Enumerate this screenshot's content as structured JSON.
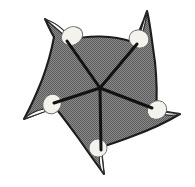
{
  "figure": {
    "caption": "",
    "canvas": {
      "width": 195,
      "height": 187,
      "background": "#ffffff"
    }
  },
  "style": {
    "background_color": "#ffffff",
    "body_fill_color": "#7c7c7c",
    "body_fill_pattern": "dither-halftone",
    "dither_dark": "#4a4a4a",
    "dither_light": "#9d9d9d",
    "outline_color": "#1a1a1a",
    "outline_width": 2.0,
    "spine_outline_width": 1.6,
    "radial_line_color": "#111111",
    "radial_line_width": 3.0,
    "pore_fill_color": "#f2f0ea",
    "pore_outline_color": "#5a5a5a"
  },
  "geometry": {
    "symmetry": "5-fold radial",
    "arm_count": 5,
    "center": {
      "x": 100,
      "y": 88
    },
    "spine_tips": [
      {
        "name": "spine-top-left",
        "x": 45,
        "y": 19
      },
      {
        "name": "spine-top-right",
        "x": 147,
        "y": 11
      },
      {
        "name": "spine-right",
        "x": 180,
        "y": 114
      },
      {
        "name": "spine-bottom",
        "x": 104,
        "y": 174
      },
      {
        "name": "spine-left",
        "x": 24,
        "y": 119
      }
    ],
    "body_vertices": [
      {
        "name": "vertex-top-left",
        "x": 69,
        "y": 44
      },
      {
        "name": "vertex-top-right",
        "x": 136,
        "y": 45
      },
      {
        "name": "vertex-right",
        "x": 155,
        "y": 109
      },
      {
        "name": "vertex-bottom",
        "x": 100,
        "y": 146
      },
      {
        "name": "vertex-left",
        "x": 53,
        "y": 104
      }
    ],
    "pores": [
      {
        "name": "pore-top-left",
        "cx": 72,
        "cy": 36,
        "rx": 11,
        "ry": 9,
        "rotation": -25
      },
      {
        "name": "pore-top-right",
        "cx": 139,
        "cy": 39,
        "rx": 10,
        "ry": 9,
        "rotation": 20
      },
      {
        "name": "pore-right",
        "cx": 157,
        "cy": 110,
        "rx": 9,
        "ry": 10,
        "rotation": 55
      },
      {
        "name": "pore-bottom",
        "cx": 98,
        "cy": 148,
        "rx": 9,
        "ry": 9,
        "rotation": 0
      },
      {
        "name": "pore-left",
        "cx": 52,
        "cy": 104,
        "rx": 10,
        "ry": 9,
        "rotation": -60
      }
    ],
    "radial_segments": [
      {
        "name": "radius-to-top-left",
        "x1": 100,
        "y1": 88,
        "x2": 67,
        "y2": 41
      },
      {
        "name": "radius-to-top-right",
        "x1": 100,
        "y1": 88,
        "x2": 137,
        "y2": 44
      },
      {
        "name": "radius-to-right",
        "x1": 100,
        "y1": 88,
        "x2": 152,
        "y2": 108
      },
      {
        "name": "radius-to-bottom",
        "x1": 100,
        "y1": 88,
        "x2": 101,
        "y2": 150
      },
      {
        "name": "radius-to-left",
        "x1": 100,
        "y1": 88,
        "x2": 54,
        "y2": 103
      }
    ]
  },
  "labels": {
    "figure_caption": "",
    "scale_bar": "",
    "annotation": ""
  }
}
